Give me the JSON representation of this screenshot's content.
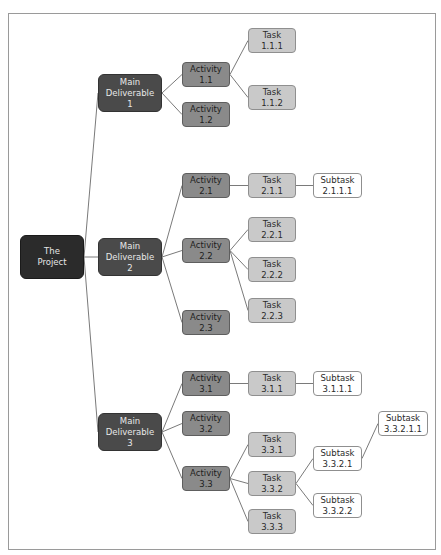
{
  "diagram": {
    "type": "work-breakdown-structure",
    "colors": {
      "root": "#2b2b2b",
      "deliverable": "#4a4a4a",
      "activity": "#8a8a8a",
      "task": "#c9c9c9",
      "subtask": "#ffffff",
      "edge": "#7a7a7a",
      "frame": "#9a9a9a"
    },
    "nodes": [
      {
        "id": "root",
        "label": "The\nProject",
        "level": 0,
        "x": 20,
        "y": 235,
        "w": 64,
        "h": 44
      },
      {
        "id": "md1",
        "label": "Main\nDeliverable\n1",
        "level": 1,
        "x": 98,
        "y": 74,
        "w": 64,
        "h": 38
      },
      {
        "id": "md2",
        "label": "Main\nDeliverable\n2",
        "level": 1,
        "x": 98,
        "y": 238,
        "w": 64,
        "h": 38
      },
      {
        "id": "md3",
        "label": "Main\nDeliverable\n3",
        "level": 1,
        "x": 98,
        "y": 413,
        "w": 64,
        "h": 38
      },
      {
        "id": "a11",
        "label": "Activity\n1.1",
        "level": 2,
        "x": 182,
        "y": 62,
        "w": 48,
        "h": 25
      },
      {
        "id": "a12",
        "label": "Activity\n1.2",
        "level": 2,
        "x": 182,
        "y": 102,
        "w": 48,
        "h": 25
      },
      {
        "id": "a21",
        "label": "Activity\n2.1",
        "level": 2,
        "x": 182,
        "y": 173,
        "w": 48,
        "h": 25
      },
      {
        "id": "a22",
        "label": "Activity\n2.2",
        "level": 2,
        "x": 182,
        "y": 238,
        "w": 48,
        "h": 25
      },
      {
        "id": "a23",
        "label": "Activity\n2.3",
        "level": 2,
        "x": 182,
        "y": 310,
        "w": 48,
        "h": 25
      },
      {
        "id": "a31",
        "label": "Activity\n3.1",
        "level": 2,
        "x": 182,
        "y": 371,
        "w": 48,
        "h": 25
      },
      {
        "id": "a32",
        "label": "Activity\n3.2",
        "level": 2,
        "x": 182,
        "y": 411,
        "w": 48,
        "h": 25
      },
      {
        "id": "a33",
        "label": "Activity\n3.3",
        "level": 2,
        "x": 182,
        "y": 466,
        "w": 48,
        "h": 25
      },
      {
        "id": "t111",
        "label": "Task\n1.1.1",
        "level": 3,
        "x": 248,
        "y": 28,
        "w": 48,
        "h": 25
      },
      {
        "id": "t112",
        "label": "Task\n1.1.2",
        "level": 3,
        "x": 248,
        "y": 85,
        "w": 48,
        "h": 25
      },
      {
        "id": "t211",
        "label": "Task\n2.1.1",
        "level": 3,
        "x": 248,
        "y": 173,
        "w": 48,
        "h": 25
      },
      {
        "id": "t221",
        "label": "Task\n2.2.1",
        "level": 3,
        "x": 248,
        "y": 217,
        "w": 48,
        "h": 25
      },
      {
        "id": "t222",
        "label": "Task\n2.2.2",
        "level": 3,
        "x": 248,
        "y": 257,
        "w": 48,
        "h": 25
      },
      {
        "id": "t223",
        "label": "Task\n2.2.3",
        "level": 3,
        "x": 248,
        "y": 298,
        "w": 48,
        "h": 25
      },
      {
        "id": "t311",
        "label": "Task\n3.1.1",
        "level": 3,
        "x": 248,
        "y": 371,
        "w": 48,
        "h": 25
      },
      {
        "id": "t331",
        "label": "Task\n3.3.1",
        "level": 3,
        "x": 248,
        "y": 432,
        "w": 48,
        "h": 25
      },
      {
        "id": "t332",
        "label": "Task\n3.3.2",
        "level": 3,
        "x": 248,
        "y": 471,
        "w": 48,
        "h": 25
      },
      {
        "id": "t333",
        "label": "Task\n3.3.3",
        "level": 3,
        "x": 248,
        "y": 509,
        "w": 48,
        "h": 25
      },
      {
        "id": "s2111",
        "label": "Subtask\n2.1.1.1",
        "level": 4,
        "x": 313,
        "y": 173,
        "w": 49,
        "h": 25
      },
      {
        "id": "s3111",
        "label": "Subtask\n3.1.1.1",
        "level": 4,
        "x": 313,
        "y": 371,
        "w": 49,
        "h": 25
      },
      {
        "id": "s3321",
        "label": "Subtask\n3.3.2.1",
        "level": 4,
        "x": 313,
        "y": 446,
        "w": 49,
        "h": 25
      },
      {
        "id": "s3322",
        "label": "Subtask\n3.3.2.2",
        "level": 4,
        "x": 313,
        "y": 493,
        "w": 49,
        "h": 25
      },
      {
        "id": "s33211",
        "label": "Subtask\n3.3.2.1.1",
        "level": 4,
        "x": 378,
        "y": 411,
        "w": 50,
        "h": 25
      }
    ],
    "edges": [
      [
        "root",
        "md1"
      ],
      [
        "root",
        "md2"
      ],
      [
        "root",
        "md3"
      ],
      [
        "md1",
        "a11"
      ],
      [
        "md1",
        "a12"
      ],
      [
        "md2",
        "a21"
      ],
      [
        "md2",
        "a22"
      ],
      [
        "md2",
        "a23"
      ],
      [
        "md3",
        "a31"
      ],
      [
        "md3",
        "a32"
      ],
      [
        "md3",
        "a33"
      ],
      [
        "a11",
        "t111"
      ],
      [
        "a11",
        "t112"
      ],
      [
        "a21",
        "t211"
      ],
      [
        "a22",
        "t221"
      ],
      [
        "a22",
        "t222"
      ],
      [
        "a22",
        "t223"
      ],
      [
        "a31",
        "t311"
      ],
      [
        "a33",
        "t331"
      ],
      [
        "a33",
        "t332"
      ],
      [
        "a33",
        "t333"
      ],
      [
        "t211",
        "s2111"
      ],
      [
        "t311",
        "s3111"
      ],
      [
        "t332",
        "s3321"
      ],
      [
        "t332",
        "s3322"
      ],
      [
        "s3321",
        "s33211"
      ]
    ]
  }
}
